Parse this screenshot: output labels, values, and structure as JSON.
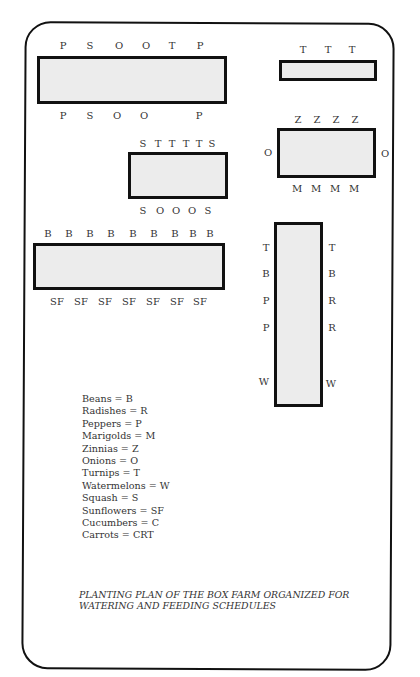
{
  "beds": [
    {
      "id": "bed-1",
      "top_labels": [
        "P",
        "S",
        "O",
        "O",
        "T",
        "P"
      ],
      "bottom_labels": [
        "P",
        "S",
        "O",
        "O",
        "",
        "P"
      ]
    },
    {
      "id": "bed-2",
      "top_labels": [
        "T",
        "T",
        "T"
      ]
    },
    {
      "id": "bed-3",
      "top_labels": [
        "Z",
        "Z",
        "Z",
        "Z"
      ],
      "bottom_labels": [
        "M",
        "M",
        "M",
        "M"
      ],
      "left_label": "O",
      "right_label": "O"
    },
    {
      "id": "bed-4",
      "top_labels": [
        "S",
        "T",
        "T",
        "T",
        "T",
        "S"
      ],
      "bottom_labels": [
        "S",
        "O",
        "O",
        "O",
        "S"
      ]
    },
    {
      "id": "bed-5",
      "top_labels": [
        "B",
        "B",
        "B",
        "B",
        "B",
        "B",
        "B",
        "B",
        "B"
      ],
      "bottom_labels": [
        "SF",
        "SF",
        "SF",
        "SF",
        "SF",
        "SF",
        "SF"
      ]
    },
    {
      "id": "bed-6",
      "left_labels": [
        "T",
        "B",
        "P",
        "P",
        "W"
      ],
      "right_labels": [
        "T",
        "B",
        "R",
        "R",
        "W"
      ]
    }
  ],
  "legend": [
    "Beans = B",
    "Radishes = R",
    "Peppers = P",
    "Marigolds = M",
    "Zinnias = Z",
    "Onions = O",
    "Turnips = T",
    "Watermelons = W",
    "Squash = S",
    "Sunflowers = SF",
    "Cucumbers = C",
    "Carrots = CRT"
  ],
  "caption": {
    "line1": "PLANTING PLAN OF THE BOX FARM ORGANIZED FOR",
    "line2": "WATERING AND FEEDING SCHEDULES"
  }
}
